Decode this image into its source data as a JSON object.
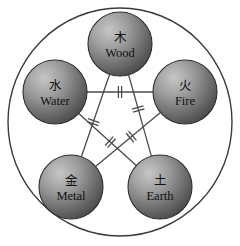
{
  "diagram": {
    "outer_circle": {
      "cx": 120,
      "cy": 122,
      "rx": 112,
      "ry": 114,
      "stroke": "#3b3b3b"
    },
    "sphere_radius": 32,
    "sphere_fill_light": "#b9b9b9",
    "sphere_fill_dark": "#4a4a4a",
    "sphere_stroke": "#2e2e2e",
    "line_color": "#4a4a4a",
    "text_color": "#111111",
    "nodes": [
      {
        "id": "wood",
        "han": "木",
        "label": "Wood",
        "cx": 120,
        "cy": 44
      },
      {
        "id": "fire",
        "han": "火",
        "label": "Fire",
        "cx": 185,
        "cy": 92
      },
      {
        "id": "earth",
        "han": "土",
        "label": "Earth",
        "cx": 160,
        "cy": 187
      },
      {
        "id": "metal",
        "han": "金",
        "label": "Metal",
        "cx": 71,
        "cy": 187
      },
      {
        "id": "water",
        "han": "水",
        "label": "Water",
        "cx": 55,
        "cy": 92
      }
    ],
    "edges": [
      {
        "id": "wood-earth",
        "from": "wood",
        "to": "earth",
        "marker_t": 0.42
      },
      {
        "id": "earth-water",
        "from": "earth",
        "to": "water",
        "marker_t": 0.45
      },
      {
        "id": "water-fire",
        "from": "water",
        "to": "fire",
        "marker_t": 0.5
      },
      {
        "id": "fire-metal",
        "from": "fire",
        "to": "metal",
        "marker_t": 0.45
      },
      {
        "id": "metal-wood",
        "from": "metal",
        "to": "wood",
        "marker_t": 0.42
      }
    ],
    "marker": {
      "type": "inhibition-bars",
      "bar_half_len": 6,
      "bar_gap": 3.2
    }
  }
}
